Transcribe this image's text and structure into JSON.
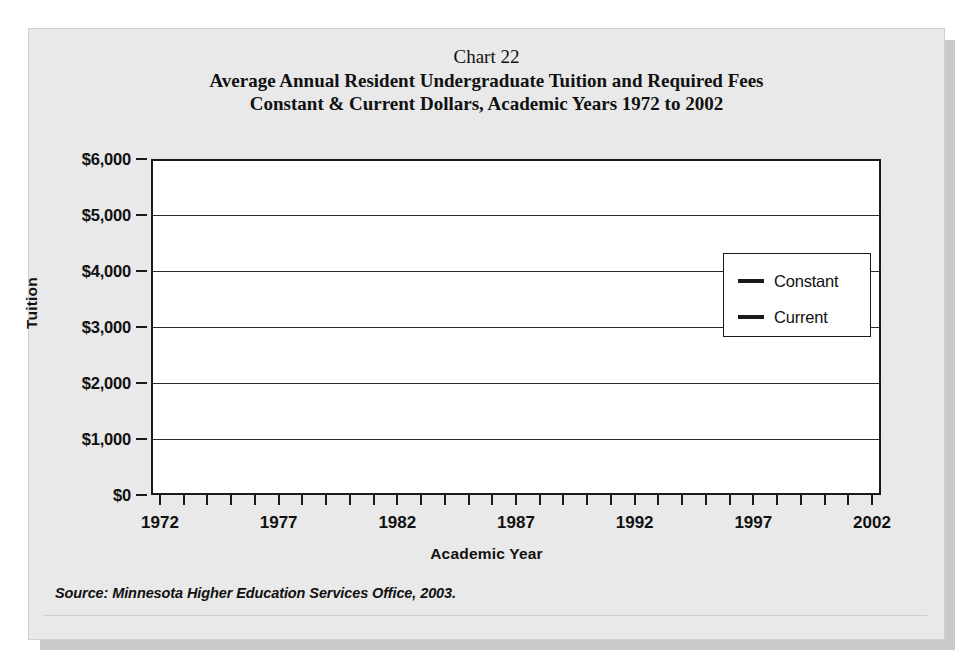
{
  "titles": {
    "chart_number": "Chart 22",
    "line1": "Average Annual Resident Undergraduate Tuition and Required Fees",
    "line2": "Constant & Current Dollars, Academic Years 1972 to 2002"
  },
  "source": "Source: Minnesota Higher Education Services Office, 2003.",
  "legend": {
    "position": "right-center",
    "entries": [
      {
        "label": "Constant",
        "color": "#1a1a1a"
      },
      {
        "label": "Current",
        "color": "#1a1a1a"
      }
    ]
  },
  "chart_data": {
    "type": "line",
    "title": "Average Annual Resident Undergraduate Tuition and Required Fees",
    "subtitle": "Constant & Current Dollars, Academic Years 1972 to 2002",
    "xlabel": "Academic Year",
    "ylabel": "Tuition",
    "xlim": [
      1972,
      2002
    ],
    "ylim": [
      0,
      6000
    ],
    "grid": true,
    "ytick_labels": [
      "$0",
      "$1,000",
      "$2,000",
      "$3,000",
      "$4,000",
      "$5,000",
      "$6,000"
    ],
    "ytick_values": [
      0,
      1000,
      2000,
      3000,
      4000,
      5000,
      6000
    ],
    "xtick_labels": [
      "1972",
      "1977",
      "1982",
      "1987",
      "1992",
      "1997",
      "2002"
    ],
    "xtick_values": [
      1972,
      1977,
      1982,
      1987,
      1992,
      1997,
      2002
    ],
    "x": [
      1972,
      1973,
      1974,
      1975,
      1976,
      1977,
      1978,
      1979,
      1980,
      1981,
      1982,
      1983,
      1984,
      1985,
      1986,
      1987,
      1988,
      1989,
      1990,
      1991,
      1992,
      1993,
      1994,
      1995,
      1996,
      1997,
      1998,
      1999,
      2000,
      2001,
      2002
    ],
    "series": [
      {
        "name": "Constant",
        "color": "#1a1a1a",
        "values": [
          2150,
          2400,
          2520,
          2500,
          2420,
          2520,
          2520,
          2510,
          2560,
          2590,
          2620,
          2780,
          2940,
          3080,
          3140,
          3230,
          3320,
          3420,
          3470,
          3380,
          3520,
          3640,
          3900,
          3950,
          4010,
          4350,
          4560,
          4500,
          4540,
          4720,
          4980
        ]
      },
      {
        "name": "Current",
        "color": "#1a1a1a",
        "values": [
          560,
          640,
          700,
          760,
          820,
          880,
          960,
          1060,
          1170,
          1300,
          1450,
          1650,
          1840,
          2020,
          2150,
          2300,
          2450,
          2530,
          2700,
          2840,
          3000,
          3230,
          3440,
          3580,
          3660,
          3960,
          4330,
          4470,
          4580,
          4960,
          5680
        ]
      }
    ]
  }
}
